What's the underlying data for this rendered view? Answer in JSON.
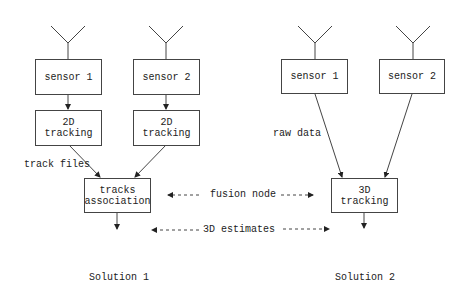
{
  "diagram": {
    "solution1": {
      "caption": "Solution 1",
      "sensor1": "sensor 1",
      "sensor2": "sensor 2",
      "tracking1": "2D tracking",
      "tracking2": "2D tracking",
      "edge_label": "track files",
      "association_line1": "tracks",
      "association_line2": "association"
    },
    "solution2": {
      "caption": "Solution 2",
      "sensor1": "sensor 1",
      "sensor2": "sensor 2",
      "edge_label": "raw data",
      "tracking": "3D tracking"
    },
    "shared_labels": {
      "fusion_node": "fusion node",
      "estimates": "3D estimates"
    }
  }
}
